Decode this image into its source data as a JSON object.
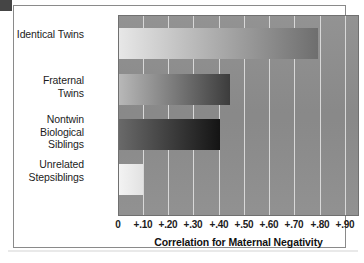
{
  "figure": {
    "corner_mark": "dark-corner-block"
  },
  "chart_data": {
    "type": "bar",
    "orientation": "horizontal",
    "title": "",
    "xlabel": "Correlation for Maternal Negativity",
    "ylabel": "",
    "categories": [
      "Identical Twins",
      "Fraternal Twins",
      "Nontwin\nBiological Siblings",
      "Unrelated\nStepsiblings"
    ],
    "values": [
      0.79,
      0.44,
      0.4,
      0.1
    ],
    "xlim": [
      0,
      0.95
    ],
    "xticks": [
      0,
      0.1,
      0.2,
      0.3,
      0.4,
      0.5,
      0.6,
      0.7,
      0.8,
      0.9
    ],
    "xtick_labels": [
      "0",
      "+.10",
      "+.20",
      "+.30",
      "+.40",
      "+.50",
      "+.60",
      "+.70",
      "+.80",
      "+.90"
    ],
    "grid": true,
    "grid_axis": "x",
    "legend": false,
    "plot_background": "#8d8d8d",
    "gridline_color": "#d8d8d8",
    "bars": [
      {
        "label": "Identical Twins",
        "value": 0.79,
        "gradient_from": "#e8e8e8",
        "gradient_to": "#6e6e6e"
      },
      {
        "label": "Fraternal Twins",
        "value": 0.44,
        "gradient_from": "#b9b9b9",
        "gradient_to": "#3c3c3c"
      },
      {
        "label": "Nontwin Biological Siblings",
        "value": 0.4,
        "gradient_from": "#6a6a6a",
        "gradient_to": "#141414"
      },
      {
        "label": "Unrelated Stepsiblings",
        "value": 0.1,
        "gradient_from": "#f4f4f4",
        "gradient_to": "#e2e2e2"
      }
    ]
  }
}
